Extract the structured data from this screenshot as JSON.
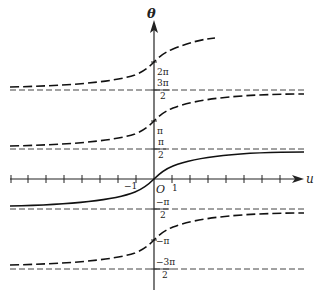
{
  "figure": {
    "title": "",
    "x_axis_label": "u",
    "y_axis_label": "θ",
    "origin_label": "O",
    "x_tick_labels": [
      {
        "value": -1,
        "label": "−1"
      },
      {
        "value": 1,
        "label": "1"
      }
    ],
    "y_level_labels": [
      {
        "value": "2π",
        "num": "2π",
        "den": ""
      },
      {
        "value": "3π/2",
        "num": "3π",
        "den": "2"
      },
      {
        "value": "π",
        "num": "π",
        "den": ""
      },
      {
        "value": "π/2",
        "num": "π",
        "den": "2"
      },
      {
        "value": "-π/2",
        "num": "−π",
        "den": "2"
      },
      {
        "value": "-π",
        "num": "−π",
        "den": ""
      },
      {
        "value": "-3π/2",
        "num": "−3π",
        "den": "2"
      }
    ],
    "asymptotes": [
      "3π/2",
      "π/2",
      "-π/2",
      "-3π/2"
    ],
    "curves": [
      {
        "name": "principal branch",
        "style": "solid",
        "through": "0 at u=0",
        "range": "-π/2 to π/2"
      },
      {
        "name": "branch +π",
        "style": "dashed",
        "through": "π at u=0",
        "range": "π/2 to 3π/2"
      },
      {
        "name": "branch +2π",
        "style": "dashed",
        "through": "2π at u=0",
        "range": "3π/2 to 5π/2"
      },
      {
        "name": "branch -π",
        "style": "dashed",
        "through": "-π at u=0",
        "range": "-3π/2 to -π/2"
      }
    ]
  },
  "labels": {
    "theta": "θ",
    "u": "u",
    "O": "O",
    "minus_one": "−1",
    "one": "1",
    "two_pi": "2π",
    "three_pi": "3π",
    "two_a": "2",
    "pi_a": "π",
    "pi_b": "π",
    "two_b": "2",
    "minus_pi_a": "−π",
    "two_c": "2",
    "minus_pi_b": "−π",
    "minus_three_pi": "−3π",
    "two_d": "2"
  }
}
